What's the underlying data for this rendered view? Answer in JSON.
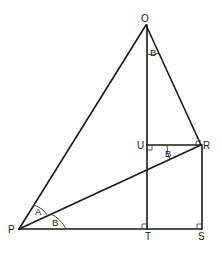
{
  "diagram": {
    "type": "geometry",
    "points": {
      "O": {
        "label": "O",
        "x": 146,
        "y": 25
      },
      "P": {
        "label": "P",
        "x": 19,
        "y": 229
      },
      "R": {
        "label": "R",
        "x": 201,
        "y": 145
      },
      "S": {
        "label": "S",
        "x": 202,
        "y": 229
      },
      "T": {
        "label": "T",
        "x": 147,
        "y": 229
      },
      "U": {
        "label": "U",
        "x": 147,
        "y": 145
      }
    },
    "segments": [
      "OP",
      "OR",
      "OT",
      "PR",
      "PS",
      "UR",
      "RS"
    ],
    "right_angles": [
      "U",
      "T",
      "S",
      "R"
    ],
    "angle_labels": [
      {
        "label": "A",
        "at": "P",
        "between": "PO-PR"
      },
      {
        "label": "B",
        "at": "P",
        "between": "PR-PS"
      },
      {
        "label": "B",
        "at": "O",
        "between": "OT-OR"
      },
      {
        "label": "B",
        "at": "R",
        "between": "RU-RP"
      }
    ]
  }
}
